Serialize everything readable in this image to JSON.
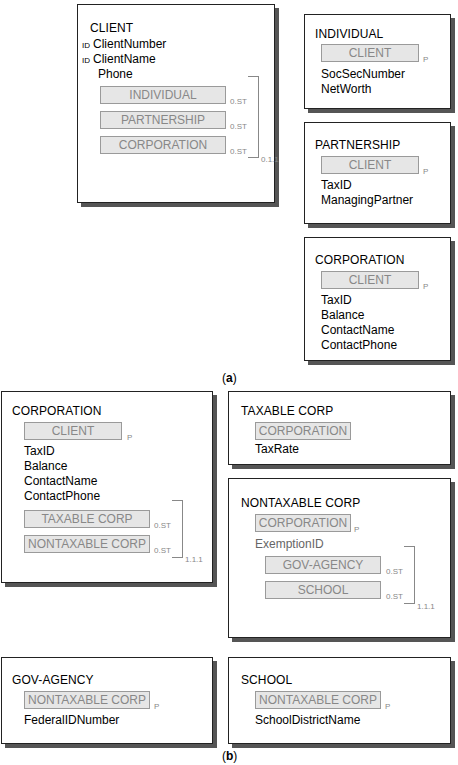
{
  "part_a": {
    "caption_open": "(",
    "caption_letter": "a",
    "caption_close": ")",
    "client": {
      "title": "CLIENT",
      "id_label": "ID",
      "attributes": [
        "ClientNumber",
        "ClientName",
        "Phone"
      ],
      "identifiers": [
        true,
        true,
        false
      ],
      "subtypes": [
        {
          "label": "INDIVIDUAL",
          "card": "0.ST"
        },
        {
          "label": "PARTNERSHIP",
          "card": "0.ST"
        },
        {
          "label": "CORPORATION",
          "card": "0.ST"
        }
      ],
      "group_card": "0.1.1"
    },
    "individual": {
      "title": "INDIVIDUAL",
      "parent": "CLIENT",
      "parent_card": "P",
      "attributes": [
        "SocSecNumber",
        "NetWorth"
      ]
    },
    "partnership": {
      "title": "PARTNERSHIP",
      "parent": "CLIENT",
      "parent_card": "P",
      "attributes": [
        "TaxID",
        "ManagingPartner"
      ]
    },
    "corporation": {
      "title": "CORPORATION",
      "parent": "CLIENT",
      "parent_card": "P",
      "attributes": [
        "TaxID",
        "Balance",
        "ContactName",
        "ContactPhone"
      ]
    }
  },
  "part_b": {
    "caption_open": "(",
    "caption_letter": "b",
    "caption_close": ")",
    "corporation": {
      "title": "CORPORATION",
      "parent": "CLIENT",
      "parent_card": "P",
      "attributes": [
        "TaxID",
        "Balance",
        "ContactName",
        "ContactPhone"
      ],
      "subtypes": [
        {
          "label": "TAXABLE CORP",
          "card": "0.ST"
        },
        {
          "label": "NONTAXABLE CORP",
          "card": "0.ST"
        }
      ],
      "group_card": "1.1.1"
    },
    "taxable_corp": {
      "title": "TAXABLE CORP",
      "parent": "CORPORATION",
      "parent_card": "",
      "attributes": [
        "TaxRate"
      ]
    },
    "nontaxable_corp": {
      "title": "NONTAXABLE CORP",
      "parent": "CORPORATION",
      "parent_card": "P",
      "attributes": [
        "ExemptionID"
      ],
      "subtypes": [
        {
          "label": "GOV-AGENCY",
          "card": "0.ST"
        },
        {
          "label": "SCHOOL",
          "card": "0.ST"
        }
      ],
      "group_card": "1.1.1"
    },
    "gov_agency": {
      "title": "GOV-AGENCY",
      "parent": "NONTAXABLE CORP",
      "parent_card": "P",
      "attributes": [
        "FederalIDNumber"
      ]
    },
    "school": {
      "title": "SCHOOL",
      "parent": "NONTAXABLE CORP",
      "parent_card": "P",
      "attributes": [
        "SchoolDistrictName"
      ]
    }
  }
}
